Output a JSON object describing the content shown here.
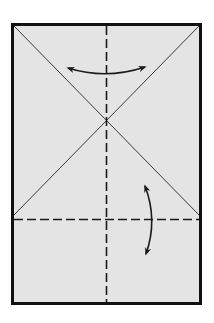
{
  "diagram": {
    "type": "origami-fold-step",
    "colors": {
      "background": "#ffffff",
      "paper": "#e4e4e4",
      "border": "#111111",
      "crease": "#333333",
      "dashed": "#1a1a1a",
      "arrow": "#1a1a1a"
    },
    "paper": {
      "x": 11,
      "y": 23,
      "width": 191,
      "height": 282,
      "border_width": 3
    },
    "creases": {
      "diagonal_1": {
        "x1": 13,
        "y1": 25,
        "x2": 199,
        "y2": 215
      },
      "diagonal_2": {
        "x1": 199,
        "y1": 25,
        "x2": 13,
        "y2": 215
      },
      "intersection": {
        "x": 106,
        "y": 122
      }
    },
    "fold_lines": {
      "vertical_valley": {
        "x1": 106,
        "y1": 25,
        "x2": 106,
        "y2": 303,
        "style": "dashed"
      },
      "horizontal_valley": {
        "x1": 13,
        "y1": 219,
        "x2": 199,
        "y2": 219,
        "style": "dashed"
      }
    },
    "arrows": [
      {
        "name": "horizontal-fold-arrow",
        "direction": "both",
        "from": [
          68,
          69
        ],
        "to": [
          145,
          69
        ]
      },
      {
        "name": "vertical-fold-arrow",
        "direction": "both",
        "from": [
          145,
          185
        ],
        "to": [
          145,
          255
        ]
      }
    ]
  }
}
